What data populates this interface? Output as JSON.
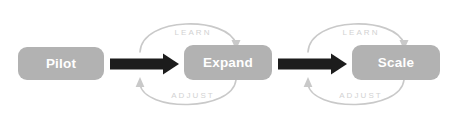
{
  "diagram": {
    "background_color": "#ffffff",
    "stage_box_color": "#b2b2b2",
    "stage_text_color": "#ffffff",
    "flow_arrow_color": "#1c1c1c",
    "loop_arc_color": "#c9c9c9",
    "loop_label_color": "#d2d2d2",
    "stages": [
      {
        "id": "pilot",
        "label": "Pilot"
      },
      {
        "id": "expand",
        "label": "Expand"
      },
      {
        "id": "scale",
        "label": "Scale"
      }
    ],
    "flow_arrows": [
      {
        "id": "pilot-to-expand",
        "from": "pilot",
        "to": "expand"
      },
      {
        "id": "expand-to-scale",
        "from": "expand",
        "to": "scale"
      }
    ],
    "feedback_loops": [
      {
        "id": "loop-pilot-expand",
        "between": [
          "pilot",
          "expand"
        ],
        "top_label": "LEARN",
        "bottom_label": "ADJUST"
      },
      {
        "id": "loop-expand-scale",
        "between": [
          "expand",
          "scale"
        ],
        "top_label": "LEARN",
        "bottom_label": "ADJUST"
      }
    ]
  }
}
